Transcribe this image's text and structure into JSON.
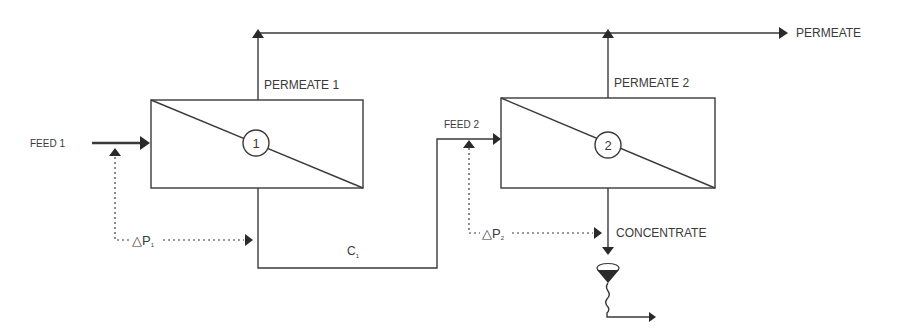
{
  "diagram": {
    "colors": {
      "line": "#3a3a3a",
      "background": "#ffffff"
    },
    "modules": [
      {
        "id": "1",
        "label": "1",
        "feed_label": "FEED 1",
        "permeate_label": "PERMEATE 1",
        "pressure_label": "△P",
        "pressure_sub": "1"
      },
      {
        "id": "2",
        "label": "2",
        "feed_label": "FEED 2",
        "permeate_label": "PERMEATE 2",
        "pressure_label": "△P",
        "pressure_sub": "2"
      }
    ],
    "streams": {
      "permeate_out": "PERMEATE",
      "intermediate": "C",
      "intermediate_sub": "1",
      "concentrate_out": "CONCENTRATE"
    }
  }
}
